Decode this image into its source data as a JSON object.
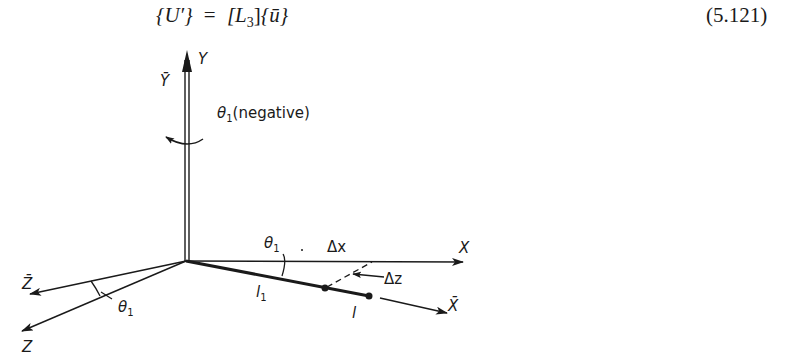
{
  "equation": {
    "lhs": "{U′}",
    "equals": "=",
    "matrix": "[L",
    "matrix_sub": "3",
    "matrix_close": "]",
    "vector": "{ū}",
    "number": "(5.121)"
  },
  "diagram": {
    "axes": {
      "y_label": "Y",
      "y_bar_label": "Ȳ",
      "x_label": "X",
      "x_bar_label": "X̄",
      "z_label": "Z",
      "z_bar_label": "Z̄"
    },
    "rotation": {
      "symbol": "θ",
      "subscript": "1",
      "note": "(negative)"
    },
    "angle_xy": {
      "symbol": "θ",
      "subscript": "1"
    },
    "angle_z": {
      "symbol": "θ",
      "subscript": "1"
    },
    "member": {
      "start_node_label": "l",
      "start_node_sub": "1",
      "end_node_label": "l"
    },
    "offsets": {
      "dx_label": "Δx",
      "dz_label": "Δz"
    },
    "colors": {
      "ink": "#1a1a1a",
      "background": "#ffffff"
    }
  }
}
